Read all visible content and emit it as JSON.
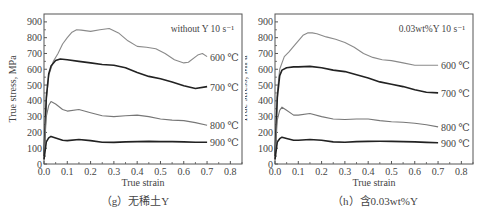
{
  "chart_data": [
    {
      "type": "line",
      "panel": "g",
      "caption": "（g）无稀土Y",
      "annotation": "without Y  10 s⁻¹",
      "xlabel": "True strain",
      "ylabel": "True stress, MPa",
      "xlim": [
        0.0,
        0.85
      ],
      "ylim": [
        0,
        950
      ],
      "xticks": [
        "0.0",
        "0.1",
        "0.2",
        "0.3",
        "0.4",
        "0.5",
        "0.6",
        "0.7",
        "0.8"
      ],
      "yticks": [
        "0",
        "100",
        "200",
        "300",
        "400",
        "500",
        "600",
        "700",
        "800",
        "900"
      ],
      "grid": false,
      "legend_position": "inline-right",
      "series": [
        {
          "name": "600 ℃",
          "color": "#8a8a8a",
          "x": [
            0.0,
            0.01,
            0.02,
            0.04,
            0.06,
            0.08,
            0.1,
            0.12,
            0.14,
            0.16,
            0.2,
            0.24,
            0.28,
            0.32,
            0.36,
            0.4,
            0.44,
            0.48,
            0.52,
            0.56,
            0.6,
            0.62,
            0.66,
            0.68,
            0.7
          ],
          "y": [
            50,
            400,
            560,
            650,
            700,
            760,
            800,
            835,
            850,
            848,
            840,
            850,
            858,
            830,
            780,
            745,
            740,
            730,
            700,
            660,
            640,
            645,
            690,
            700,
            680
          ]
        },
        {
          "name": "700 ℃",
          "color": "#222222",
          "x": [
            0.0,
            0.01,
            0.02,
            0.03,
            0.05,
            0.07,
            0.1,
            0.15,
            0.2,
            0.25,
            0.3,
            0.35,
            0.4,
            0.45,
            0.5,
            0.55,
            0.6,
            0.65,
            0.7
          ],
          "y": [
            50,
            420,
            570,
            620,
            655,
            665,
            660,
            650,
            640,
            630,
            625,
            610,
            580,
            555,
            540,
            520,
            495,
            478,
            490
          ]
        },
        {
          "name": "800 ℃",
          "color": "#777777",
          "x": [
            0.0,
            0.01,
            0.02,
            0.03,
            0.05,
            0.08,
            0.1,
            0.15,
            0.2,
            0.25,
            0.3,
            0.35,
            0.4,
            0.45,
            0.5,
            0.55,
            0.6,
            0.65,
            0.7
          ],
          "y": [
            50,
            300,
            370,
            395,
            380,
            345,
            335,
            345,
            325,
            305,
            300,
            305,
            310,
            300,
            285,
            278,
            275,
            262,
            245
          ]
        },
        {
          "name": "900 ℃",
          "color": "#222222",
          "x": [
            0.0,
            0.01,
            0.02,
            0.03,
            0.05,
            0.08,
            0.1,
            0.15,
            0.2,
            0.25,
            0.3,
            0.35,
            0.4,
            0.45,
            0.5,
            0.55,
            0.6,
            0.65,
            0.7
          ],
          "y": [
            30,
            140,
            165,
            175,
            165,
            150,
            148,
            155,
            148,
            138,
            137,
            140,
            142,
            143,
            142,
            142,
            140,
            138,
            138
          ]
        }
      ]
    },
    {
      "type": "line",
      "panel": "h",
      "caption": "（h）含0.03wt%Y",
      "annotation": "0.03wt%Y  10 s⁻¹",
      "xlabel": "True strain",
      "ylabel": "True stress, MPa",
      "xlim": [
        0.0,
        0.85
      ],
      "ylim": [
        0,
        950
      ],
      "xticks": [
        "0.0",
        "0.1",
        "0.2",
        "0.3",
        "0.4",
        "0.5",
        "0.6",
        "0.7",
        "0.8"
      ],
      "yticks": [
        "0",
        "100",
        "200",
        "300",
        "400",
        "500",
        "600",
        "700",
        "800",
        "900"
      ],
      "grid": false,
      "legend_position": "inline-right",
      "series": [
        {
          "name": "600 ℃",
          "color": "#8a8a8a",
          "x": [
            0.0,
            0.01,
            0.02,
            0.04,
            0.06,
            0.08,
            0.1,
            0.12,
            0.14,
            0.16,
            0.18,
            0.22,
            0.26,
            0.3,
            0.34,
            0.38,
            0.42,
            0.46,
            0.5,
            0.55,
            0.6,
            0.65,
            0.7
          ],
          "y": [
            50,
            450,
            600,
            680,
            710,
            745,
            780,
            815,
            830,
            830,
            825,
            805,
            790,
            770,
            740,
            700,
            675,
            660,
            655,
            640,
            625,
            625,
            625
          ]
        },
        {
          "name": "700 ℃",
          "color": "#222222",
          "x": [
            0.0,
            0.01,
            0.02,
            0.03,
            0.05,
            0.08,
            0.1,
            0.15,
            0.2,
            0.25,
            0.3,
            0.35,
            0.4,
            0.45,
            0.5,
            0.55,
            0.6,
            0.65,
            0.7
          ],
          "y": [
            50,
            420,
            560,
            595,
            610,
            615,
            615,
            618,
            610,
            595,
            585,
            565,
            545,
            520,
            505,
            490,
            470,
            455,
            450
          ]
        },
        {
          "name": "800 ℃",
          "color": "#777777",
          "x": [
            0.0,
            0.01,
            0.02,
            0.03,
            0.05,
            0.08,
            0.1,
            0.15,
            0.2,
            0.25,
            0.3,
            0.35,
            0.4,
            0.45,
            0.5,
            0.55,
            0.6,
            0.65,
            0.7
          ],
          "y": [
            50,
            280,
            340,
            360,
            340,
            310,
            310,
            320,
            300,
            285,
            282,
            285,
            285,
            275,
            268,
            265,
            258,
            248,
            235
          ]
        },
        {
          "name": "900 ℃",
          "color": "#222222",
          "x": [
            0.0,
            0.01,
            0.02,
            0.03,
            0.05,
            0.08,
            0.1,
            0.15,
            0.2,
            0.25,
            0.3,
            0.35,
            0.4,
            0.45,
            0.5,
            0.55,
            0.6,
            0.65,
            0.7
          ],
          "y": [
            30,
            140,
            160,
            170,
            162,
            150,
            150,
            155,
            150,
            140,
            138,
            142,
            143,
            144,
            143,
            142,
            140,
            137,
            135
          ]
        }
      ]
    }
  ]
}
